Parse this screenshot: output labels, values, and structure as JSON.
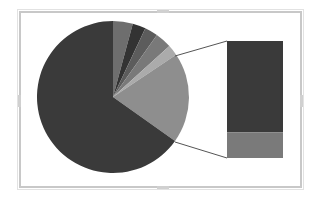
{
  "chart_data": {
    "type": "pie-of-bar",
    "title": "",
    "legend": "none",
    "pie": {
      "center": [
        113,
        97
      ],
      "radius": 76,
      "start_angle_deg": 0,
      "slices": [
        {
          "label": "Slice 1",
          "value": 4.2,
          "color": "#6e6e6e"
        },
        {
          "label": "Slice 2",
          "value": 2.8,
          "color": "#333333"
        },
        {
          "label": "Slice 3",
          "value": 2.8,
          "color": "#5c5c5c"
        },
        {
          "label": "Slice 4",
          "value": 3.5,
          "color": "#797979"
        },
        {
          "label": "Slice 5",
          "value": 2.3,
          "color": "#ababab"
        },
        {
          "label": "Other (breakout)",
          "value": 19.2,
          "color": "#8e8e8e"
        },
        {
          "label": "Slice 7",
          "value": 65.2,
          "color": "#3a3a3a"
        }
      ]
    },
    "bar": {
      "x": 227,
      "y": 41,
      "width": 56,
      "height": 117,
      "segments": [
        {
          "label": "Bar segment 1",
          "value": 78,
          "color": "#3a3a3a"
        },
        {
          "label": "Bar segment 2",
          "value": 22,
          "color": "#7a7a7a"
        }
      ]
    },
    "connectors": [
      {
        "from": [
          175,
          56
        ],
        "to": [
          227,
          41
        ]
      },
      {
        "from": [
          175,
          142
        ],
        "to": [
          227,
          158
        ]
      }
    ],
    "colors": {
      "frame": "#c8c8c8",
      "connector": "#555555"
    }
  }
}
